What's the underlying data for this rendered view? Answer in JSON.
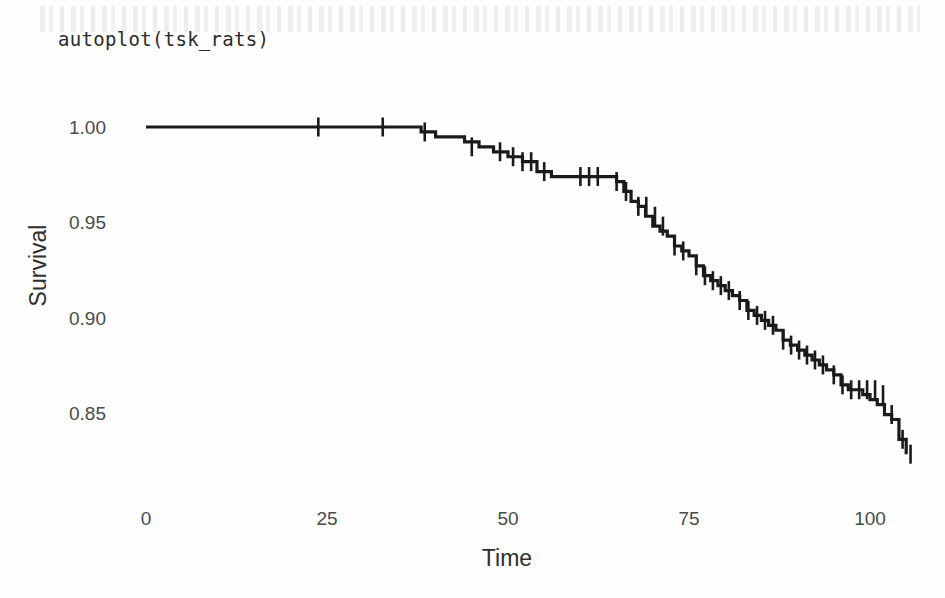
{
  "title": "autoplot(tsk_rats)",
  "axis": {
    "x_label": "Time",
    "y_label": "Survival",
    "x_ticks": [
      "0",
      "25",
      "50",
      "75",
      "100"
    ],
    "y_ticks": [
      "1.00",
      "0.95",
      "0.90",
      "0.85"
    ]
  },
  "colors": {
    "background": "#fefefe",
    "line": "#1a1a1a",
    "tick_text": "#4a4a4a",
    "axis_title": "#2e2e2e"
  },
  "chart_data": {
    "type": "line",
    "subtype": "kaplan-meier-step",
    "title": "autoplot(tsk_rats)",
    "xlabel": "Time",
    "ylabel": "Survival",
    "xlim": [
      0,
      107
    ],
    "ylim": [
      0.822,
      1.003
    ],
    "grid": false,
    "legend": null,
    "x_ticks": [
      0,
      25,
      50,
      75,
      100
    ],
    "y_ticks": [
      1.0,
      0.95,
      0.9,
      0.85
    ],
    "step_direction": "hv",
    "series": [
      {
        "name": "Survival probability",
        "x": [
          0,
          34,
          38,
          40,
          44,
          46,
          48,
          50,
          52,
          54,
          56,
          63,
          65,
          66,
          67,
          68,
          69,
          70,
          71,
          72,
          73,
          74,
          75,
          76,
          77,
          78,
          79,
          80,
          81,
          82,
          83,
          84,
          85,
          86,
          87,
          88,
          89,
          90,
          91,
          92,
          93,
          94,
          95,
          96,
          97,
          98,
          99,
          100,
          101,
          102,
          103,
          104,
          105
        ],
        "y": [
          1.0,
          1.0,
          0.9974,
          0.9948,
          0.9922,
          0.9896,
          0.987,
          0.9844,
          0.9818,
          0.9766,
          0.974,
          0.974,
          0.9714,
          0.9662,
          0.961,
          0.9584,
          0.9532,
          0.948,
          0.9454,
          0.9428,
          0.9376,
          0.935,
          0.9324,
          0.9272,
          0.922,
          0.9194,
          0.9168,
          0.9142,
          0.9116,
          0.909,
          0.9038,
          0.9012,
          0.8986,
          0.896,
          0.8934,
          0.8882,
          0.8856,
          0.883,
          0.8804,
          0.8778,
          0.8752,
          0.8726,
          0.87,
          0.8648,
          0.8622,
          0.8622,
          0.8596,
          0.857,
          0.8544,
          0.8492,
          0.8466,
          0.8362,
          0.8284
        ]
      }
    ],
    "censor_marks": {
      "symbol": "+",
      "description": "vertical tick marks on the step curve indicating censored observations",
      "points": [
        {
          "x": 23.8,
          "y": 1.0
        },
        {
          "x": 32.7,
          "y": 1.0
        },
        {
          "x": 38.5,
          "y": 0.9974
        },
        {
          "x": 45.0,
          "y": 0.9896
        },
        {
          "x": 48.9,
          "y": 0.987
        },
        {
          "x": 50.7,
          "y": 0.9844
        },
        {
          "x": 52.0,
          "y": 0.9818
        },
        {
          "x": 53.2,
          "y": 0.9818
        },
        {
          "x": 55.0,
          "y": 0.9766
        },
        {
          "x": 60.0,
          "y": 0.974
        },
        {
          "x": 61.2,
          "y": 0.974
        },
        {
          "x": 62.4,
          "y": 0.974
        },
        {
          "x": 65.0,
          "y": 0.9714
        },
        {
          "x": 66.3,
          "y": 0.9662
        },
        {
          "x": 68.0,
          "y": 0.9584
        },
        {
          "x": 69.1,
          "y": 0.9584
        },
        {
          "x": 70.3,
          "y": 0.9532
        },
        {
          "x": 71.4,
          "y": 0.948
        },
        {
          "x": 73.0,
          "y": 0.9376
        },
        {
          "x": 74.2,
          "y": 0.935
        },
        {
          "x": 76.0,
          "y": 0.9272
        },
        {
          "x": 77.2,
          "y": 0.922
        },
        {
          "x": 78.3,
          "y": 0.9194
        },
        {
          "x": 79.4,
          "y": 0.9168
        },
        {
          "x": 80.5,
          "y": 0.9142
        },
        {
          "x": 82.0,
          "y": 0.909
        },
        {
          "x": 83.2,
          "y": 0.9038
        },
        {
          "x": 84.4,
          "y": 0.9012
        },
        {
          "x": 85.5,
          "y": 0.8986
        },
        {
          "x": 86.6,
          "y": 0.896
        },
        {
          "x": 88.0,
          "y": 0.8882
        },
        {
          "x": 89.1,
          "y": 0.8856
        },
        {
          "x": 90.2,
          "y": 0.883
        },
        {
          "x": 91.3,
          "y": 0.8804
        },
        {
          "x": 92.4,
          "y": 0.8778
        },
        {
          "x": 93.5,
          "y": 0.8752
        },
        {
          "x": 95.0,
          "y": 0.87
        },
        {
          "x": 96.2,
          "y": 0.8648
        },
        {
          "x": 97.4,
          "y": 0.8622
        },
        {
          "x": 98.5,
          "y": 0.8622
        },
        {
          "x": 99.6,
          "y": 0.8622
        },
        {
          "x": 100.7,
          "y": 0.8622
        },
        {
          "x": 101.8,
          "y": 0.8596
        },
        {
          "x": 103.0,
          "y": 0.8492
        },
        {
          "x": 104.5,
          "y": 0.8362
        },
        {
          "x": 105.6,
          "y": 0.8284
        }
      ]
    }
  }
}
